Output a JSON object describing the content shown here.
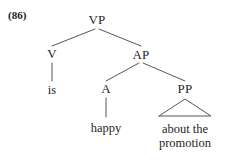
{
  "figure": {
    "example_number": "(86)",
    "type": "syntax-tree",
    "ink_color": "#262626",
    "line_color": "#555555",
    "background_color": "#ffffff"
  },
  "tree": {
    "nodes": [
      {
        "id": "vp",
        "label": "VP",
        "x": 97,
        "y": 20
      },
      {
        "id": "v",
        "label": "V",
        "x": 52,
        "y": 54
      },
      {
        "id": "ap",
        "label": "AP",
        "x": 141,
        "y": 55
      },
      {
        "id": "a",
        "label": "A",
        "x": 106,
        "y": 89
      },
      {
        "id": "pp",
        "label": "PP",
        "x": 185,
        "y": 89
      }
    ],
    "leaves": [
      {
        "id": "leaf-is",
        "lines": [
          "is"
        ],
        "x": 52,
        "y": 90
      },
      {
        "id": "leaf-happy",
        "lines": [
          "happy"
        ],
        "x": 106,
        "y": 128
      },
      {
        "id": "leaf-about-the-promotion",
        "lines": [
          "about the",
          "promotion"
        ],
        "x": 185,
        "y": 136
      }
    ],
    "edges": [
      {
        "id": "vp-v",
        "from": "vp",
        "to": "v",
        "x1": 95,
        "y1": 29,
        "x2": 52,
        "y2": 46
      },
      {
        "id": "vp-ap",
        "from": "vp",
        "to": "ap",
        "x1": 99,
        "y1": 29,
        "x2": 141,
        "y2": 46
      },
      {
        "id": "v-is",
        "from": "v",
        "to": "leaf-is",
        "x1": 52,
        "y1": 63,
        "x2": 52,
        "y2": 81
      },
      {
        "id": "ap-a",
        "from": "ap",
        "to": "a",
        "x1": 139,
        "y1": 63,
        "x2": 106,
        "y2": 81
      },
      {
        "id": "ap-pp",
        "from": "ap",
        "to": "pp",
        "x1": 143,
        "y1": 63,
        "x2": 185,
        "y2": 81
      },
      {
        "id": "a-happy",
        "from": "a",
        "to": "leaf-happy",
        "x1": 106,
        "y1": 98,
        "x2": 106,
        "y2": 117
      }
    ],
    "triangle": {
      "id": "pp-triangle",
      "apex_x": 185,
      "apex_y": 99,
      "left_x": 159,
      "right_x": 211,
      "base_y": 116
    }
  }
}
